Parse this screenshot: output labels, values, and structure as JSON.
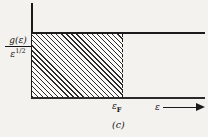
{
  "figure": {
    "caption": "(c)",
    "y_axis": {
      "label_numerator": "g(ε)",
      "label_denominator_base": "ε",
      "label_denominator_exponent": "1/2"
    },
    "x_axis": {
      "label": "ε",
      "arrow_icon": "right-arrow-icon",
      "tick_label_base": "ε",
      "tick_label_subscript": "F"
    }
  },
  "chart_data": {
    "type": "area",
    "title": "(c)",
    "xlabel": "ε",
    "ylabel": "g(ε)/ε^1/2",
    "x": [
      0,
      0.525,
      0.525,
      1.0
    ],
    "values": [
      1,
      1,
      1,
      1
    ],
    "series": [
      {
        "name": "g(ε)/ε^1/2",
        "values": [
          1,
          1,
          1,
          1
        ],
        "note": "constant-valued horizontal line across full ε range"
      }
    ],
    "shaded_region": {
      "name": "occupied states",
      "x_from": 0,
      "x_to": 0.525,
      "y_from": 0,
      "y_to": 1,
      "fill": "diagonal-hatch"
    },
    "annotations": [
      {
        "text": "ε_F",
        "x": 0.525,
        "y": 0,
        "style": "dashed-vertical-line"
      }
    ],
    "xlim": [
      0,
      1
    ],
    "ylim": [
      0,
      1.05
    ],
    "grid": false,
    "legend": "none",
    "colors": {
      "ink": "#1b1b1b",
      "background": "#f4f2ef",
      "hatch": "#2b2b2b"
    }
  }
}
